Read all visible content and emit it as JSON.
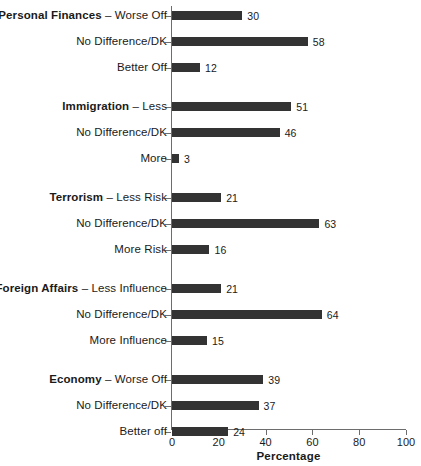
{
  "chart_data": {
    "type": "bar",
    "orientation": "horizontal",
    "title": "",
    "xlabel": "Percentage",
    "ylabel": "",
    "xlim": [
      0,
      100
    ],
    "xticks": [
      0,
      20,
      40,
      60,
      80,
      100
    ],
    "grid": false,
    "legend": null,
    "bar_color": "#333333",
    "axis_color": "#6d6d6d",
    "groups": [
      {
        "name": "Personal Finances",
        "bars": [
          {
            "group": "Personal Finances",
            "separator": " – ",
            "label": "Worse Off",
            "is_group_header": true,
            "value": 30
          },
          {
            "group": "",
            "separator": "",
            "label": "No Difference/DK",
            "is_group_header": false,
            "value": 58
          },
          {
            "group": "",
            "separator": "",
            "label": "Better Off",
            "is_group_header": false,
            "value": 12
          }
        ]
      },
      {
        "name": "Immigration",
        "bars": [
          {
            "group": "Immigration",
            "separator": " – ",
            "label": "Less",
            "is_group_header": true,
            "value": 51
          },
          {
            "group": "",
            "separator": "",
            "label": "No Difference/DK",
            "is_group_header": false,
            "value": 46
          },
          {
            "group": "",
            "separator": "",
            "label": "More",
            "is_group_header": false,
            "value": 3
          }
        ]
      },
      {
        "name": "Terrorism",
        "bars": [
          {
            "group": "Terrorism",
            "separator": " – ",
            "label": "Less Risk",
            "is_group_header": true,
            "value": 21
          },
          {
            "group": "",
            "separator": "",
            "label": "No Difference/DK",
            "is_group_header": false,
            "value": 63
          },
          {
            "group": "",
            "separator": "",
            "label": "More Risk",
            "is_group_header": false,
            "value": 16
          }
        ]
      },
      {
        "name": "Foreign Affairs",
        "bars": [
          {
            "group": "Foreign Affairs",
            "separator": " – ",
            "label": "Less Influence",
            "is_group_header": true,
            "value": 21
          },
          {
            "group": "",
            "separator": "",
            "label": "No Difference/DK",
            "is_group_header": false,
            "value": 64
          },
          {
            "group": "",
            "separator": "",
            "label": "More Influence",
            "is_group_header": false,
            "value": 15
          }
        ]
      },
      {
        "name": "Economy",
        "bars": [
          {
            "group": "Economy",
            "separator": " – ",
            "label": "Worse Off",
            "is_group_header": true,
            "value": 39
          },
          {
            "group": "",
            "separator": "",
            "label": "No Difference/DK",
            "is_group_header": false,
            "value": 37
          },
          {
            "group": "",
            "separator": "",
            "label": "Better off",
            "is_group_header": false,
            "value": 24
          }
        ]
      }
    ]
  }
}
